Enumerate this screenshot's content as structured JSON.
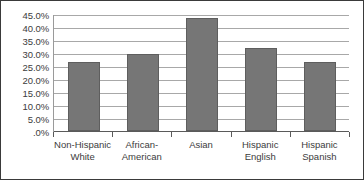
{
  "chart_data": {
    "type": "bar",
    "title": "",
    "subtitle": "",
    "xlabel": "",
    "ylabel": "",
    "categories": [
      "Non-Hispanic White",
      "African-American",
      "Asian",
      "Hispanic English",
      "Hispanic Spanish"
    ],
    "category_lines": [
      [
        "Non-Hispanic",
        "White"
      ],
      [
        "African-",
        "American"
      ],
      [
        "Asian"
      ],
      [
        "Hispanic",
        "English"
      ],
      [
        "Hispanic",
        "Spanish"
      ]
    ],
    "values": [
      26.5,
      29.5,
      43.5,
      32.0,
      26.5
    ],
    "value_labels": [
      "26.5%",
      "29.5%",
      "43.5%",
      "32.0%",
      "26.5%"
    ],
    "ylim": [
      0,
      45
    ],
    "ytick_values": [
      45,
      40,
      35,
      30,
      25,
      20,
      15,
      10,
      5,
      0
    ],
    "ytick_labels": [
      "45.0%",
      "40.0%",
      "35.0%",
      "30.0%",
      "25.0%",
      "20.0%",
      "15.0%",
      "10.0%",
      "5.0%",
      ".0%"
    ],
    "grid": true,
    "legend": false,
    "legend_position": "none",
    "bar_color": "#767676",
    "bar_border_color": "#5e5e5e",
    "gridline_color": "#a8a8a8",
    "axis_color": "#5a5a5a",
    "frame_color": "#3a3a3a",
    "text_color": "#3c3c3c",
    "background_color": "#ffffff"
  }
}
